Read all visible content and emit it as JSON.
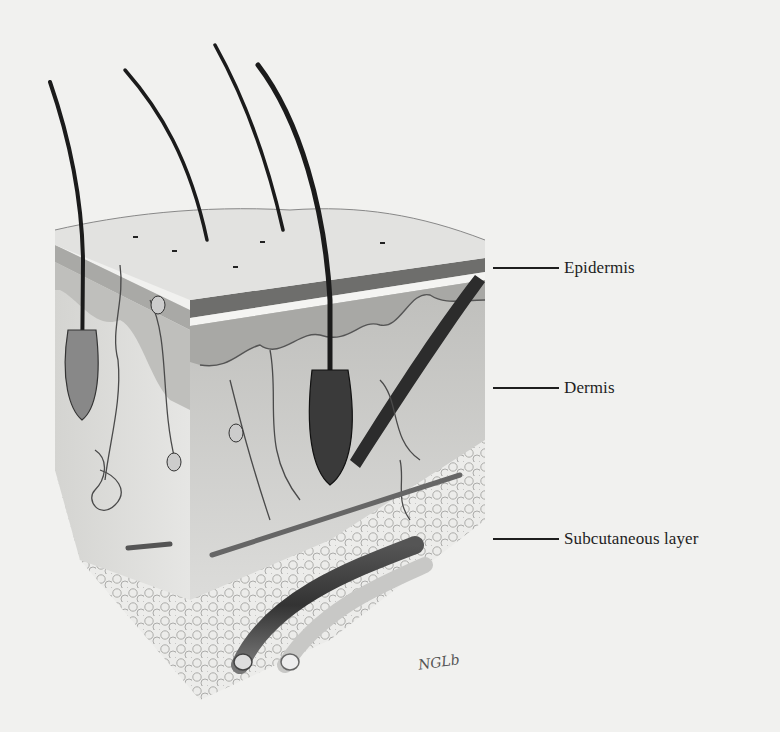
{
  "figure": {
    "labels": [
      {
        "id": "epidermis",
        "text": "Epidermis",
        "y": 269
      },
      {
        "id": "dermis",
        "text": "Dermis",
        "y": 389
      },
      {
        "id": "subcutaneous",
        "text": "Subcutaneous layer",
        "y": 540
      }
    ],
    "signature": "NGLb"
  },
  "colors": {
    "background": "#f1f1ef",
    "ink": "#1e1e1e",
    "epidermis_top": "#e4e4e2",
    "dermis": "#cfcfcc",
    "fat": "#e9e9e7"
  }
}
